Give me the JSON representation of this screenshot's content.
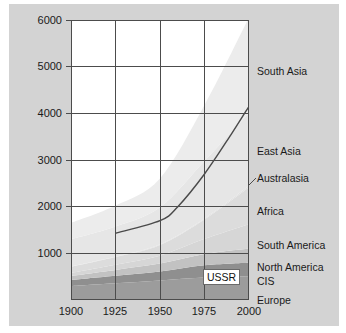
{
  "chart_data": {
    "type": "area",
    "title": "",
    "subtitle": "",
    "xlabel": "",
    "ylabel": "",
    "stacked": true,
    "grid": true,
    "legend_position": "right-inline",
    "xlim": [
      1900,
      2000
    ],
    "ylim": [
      0,
      6000
    ],
    "x": [
      1900,
      1925,
      1950,
      1975,
      2000
    ],
    "xticks": [
      "1900",
      "1925",
      "1950",
      "1975",
      "2000"
    ],
    "yticks": [
      "1000",
      "2000",
      "3000",
      "4000",
      "5000",
      "6000"
    ],
    "ytick_values": [
      1000,
      2000,
      3000,
      4000,
      5000,
      6000
    ],
    "series": [
      {
        "name": "Europe",
        "color": "#9c9c9c",
        "values": [
          300,
          360,
          420,
          480,
          510
        ]
      },
      {
        "name": "CIS",
        "color": "#8f8f8f",
        "values": [
          130,
          160,
          190,
          265,
          290
        ]
      },
      {
        "name": "North America",
        "color": "#c2c2c2",
        "values": [
          85,
          125,
          170,
          240,
          305
        ]
      },
      {
        "name": "South America",
        "color": "#d6d6d6",
        "values": [
          65,
          110,
          170,
          325,
          520
        ]
      },
      {
        "name": "Africa",
        "color": "#dcdcdc",
        "values": [
          130,
          165,
          230,
          415,
          790
        ]
      },
      {
        "name": "Australasia",
        "color": "#e2e2e2",
        "values": [
          10,
          13,
          16,
          23,
          31
        ]
      },
      {
        "name": "East Asia",
        "color": "#e6e6e6",
        "values": [
          580,
          640,
          790,
          1230,
          1560
        ]
      },
      {
        "name": "South Asia",
        "color": "#ececec",
        "values": [
          350,
          450,
          620,
          1200,
          2050
        ]
      }
    ],
    "overlay_line": {
      "name": "developing-world-population-line",
      "color": "#4a4a4a",
      "x": [
        1925,
        1950,
        1960,
        1975,
        1990,
        2000
      ],
      "y": [
        1430,
        1700,
        2000,
        2700,
        3550,
        4150
      ]
    },
    "annotations": [
      {
        "name": "ussr-label",
        "text": "USSR",
        "x": 1975,
        "y": 660
      }
    ]
  },
  "legend": {
    "items": [
      {
        "label": "South Asia"
      },
      {
        "label": "East Asia"
      },
      {
        "label": "Australasia"
      },
      {
        "label": "Africa"
      },
      {
        "label": "South America"
      },
      {
        "label": "North America"
      },
      {
        "label": "CIS"
      },
      {
        "label": "Europe"
      }
    ]
  },
  "axes": {
    "y_labels": [
      "6000",
      "5000",
      "4000",
      "3000",
      "2000",
      "1000"
    ],
    "x_labels": [
      "1900",
      "1925",
      "1950",
      "1975",
      "2000"
    ]
  },
  "annotation": {
    "ussr": "USSR"
  },
  "colors": {
    "panel_background": "#d3d3d3",
    "plot_background": "#ffffff",
    "axis": "#4c4c4c",
    "text": "#1a1a1a",
    "line": "#4a4a4a"
  }
}
